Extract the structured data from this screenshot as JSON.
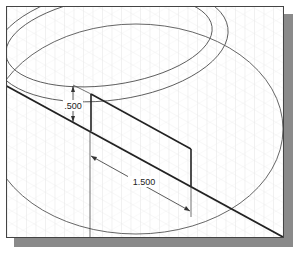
{
  "drawing": {
    "title": "Isometric sketch with dimensions",
    "dimensions": [
      {
        "id": "height",
        "label": ".500"
      },
      {
        "id": "length",
        "label": "1.500"
      }
    ],
    "colors": {
      "grid": "#d8d8d8",
      "geometry": "#222222",
      "ellipse": "#555555",
      "frame": "#444444",
      "shadow": "#8a8a8a"
    }
  }
}
